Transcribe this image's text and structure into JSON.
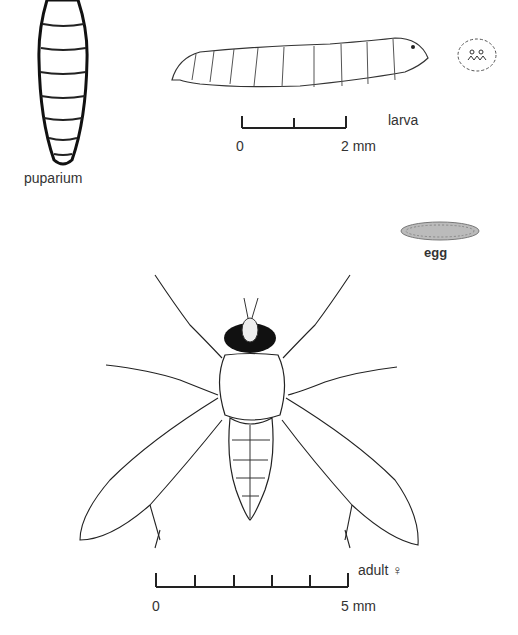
{
  "figure": {
    "stages": [
      {
        "id": "puparium",
        "label": "puparium"
      },
      {
        "id": "larva",
        "label": "larva"
      },
      {
        "id": "egg",
        "label": "egg"
      },
      {
        "id": "adult",
        "label": "adult ♀"
      }
    ],
    "scale_bars": {
      "larva": {
        "start_label": "0",
        "end_label": "2 mm",
        "ticks": 3
      },
      "adult": {
        "start_label": "0",
        "end_label": "5 mm",
        "ticks": 6
      }
    },
    "colors": {
      "ink": "#1a1a1a",
      "background": "#ffffff"
    }
  }
}
